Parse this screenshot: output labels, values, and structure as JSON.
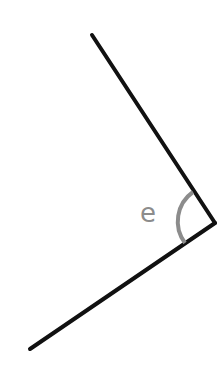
{
  "diagram": {
    "type": "angle",
    "angle_label": "e",
    "vertex": [
      215,
      223
    ],
    "ray_ends": [
      [
        92,
        35
      ],
      [
        30,
        349
      ]
    ],
    "line_color": "#111111",
    "arc_color": "#8c8c8c"
  }
}
